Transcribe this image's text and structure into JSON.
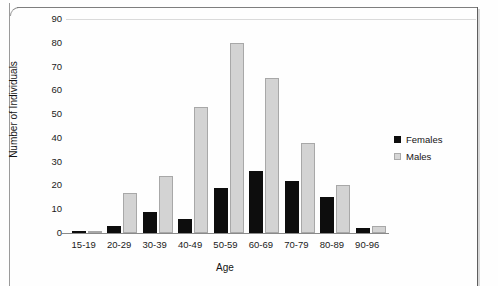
{
  "chart_data": {
    "type": "bar",
    "title": "",
    "xlabel": "Age",
    "ylabel": "Number of Individuals",
    "categories": [
      "15-19",
      "20-29",
      "30-39",
      "40-49",
      "50-59",
      "60-69",
      "70-79",
      "80-89",
      "90-96"
    ],
    "series": [
      {
        "name": "Females",
        "color": "#0d0d0d",
        "values": [
          0.5,
          3,
          9,
          6,
          19,
          26,
          22,
          15,
          2
        ]
      },
      {
        "name": "Males",
        "color": "#d3d3d3",
        "values": [
          0.4,
          17,
          24,
          53,
          80,
          65,
          38,
          20,
          3
        ]
      }
    ],
    "ylim": [
      0,
      90
    ],
    "yticks": [
      0,
      10,
      20,
      30,
      40,
      50,
      60,
      70,
      80,
      90
    ],
    "ytick_labels": [
      "0",
      "10",
      "20",
      "30",
      "40",
      "50",
      "60",
      "70",
      "80",
      "90"
    ],
    "grid": false,
    "legend_position": "right"
  },
  "legend": {
    "items": [
      {
        "label": "Females",
        "swatch": "black-square-swatch"
      },
      {
        "label": "Males",
        "swatch": "gray-square-swatch"
      }
    ]
  }
}
